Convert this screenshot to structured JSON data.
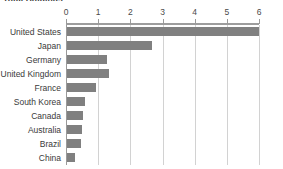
{
  "chart_data": {
    "type": "bar",
    "orientation": "horizontal",
    "title": "Total Holdings",
    "xlabel": "",
    "ylabel": "",
    "xlim": [
      0,
      6
    ],
    "xticks": [
      0,
      1,
      2,
      3,
      4,
      5,
      6
    ],
    "xtick_labels": [
      "0",
      "1",
      "2",
      "3",
      "4",
      "5",
      "6"
    ],
    "grid": true,
    "grid_axis": "x",
    "legend": false,
    "axis_position": "top",
    "bar_color": "#808080",
    "gridline_color": "#d2d2d2",
    "categories": [
      "United States",
      "Japan",
      "Germany",
      "United Kingdom",
      "France",
      "South Korea",
      "Canada",
      "Australia",
      "Brazil",
      "China"
    ],
    "values": [
      5.98,
      2.65,
      1.25,
      1.32,
      0.9,
      0.55,
      0.5,
      0.48,
      0.45,
      0.25
    ]
  }
}
